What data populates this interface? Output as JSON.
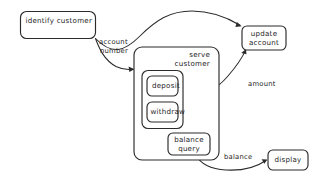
{
  "diagram": {
    "type": "dataflow-diagram",
    "background_color": "#ffffff",
    "stroke_color": "#2b2b2b",
    "text_color": "#1d1d1d",
    "nodes": [
      {
        "id": "identify-customer",
        "label": "identify customer",
        "shape": "rounded-rectangle"
      },
      {
        "id": "serve-customer",
        "label_line1": "serve",
        "label_line2": "customer",
        "shape": "rounded-rectangle",
        "role": "container"
      },
      {
        "id": "transaction-group",
        "shape": "rounded-rectangle",
        "role": "container"
      },
      {
        "id": "deposit",
        "label": "deposit",
        "shape": "rounded-rectangle"
      },
      {
        "id": "withdraw",
        "label": "withdraw",
        "shape": "rounded-rectangle"
      },
      {
        "id": "balance-query",
        "label_line1": "balance",
        "label_line2": "query",
        "shape": "rounded-rectangle"
      },
      {
        "id": "update-account",
        "label_line1": "update",
        "label_line2": "account",
        "shape": "rounded-rectangle"
      },
      {
        "id": "display",
        "label": "display",
        "shape": "rounded-rectangle"
      }
    ],
    "edges": [
      {
        "id": "edge-account-number",
        "from": "identify-customer",
        "to": "serve-customer",
        "label_line1": "account",
        "label_line2": "number",
        "arrow": true
      },
      {
        "id": "edge-identify-to-update",
        "from": "identify-customer",
        "to": "update-account",
        "label": "",
        "arrow": true
      },
      {
        "id": "edge-amount",
        "from": "transaction-group",
        "to": "update-account",
        "label": "amount",
        "arrow": true
      },
      {
        "id": "edge-balance",
        "from": "balance-query",
        "to": "display",
        "label": "balance",
        "arrow": true
      }
    ]
  }
}
